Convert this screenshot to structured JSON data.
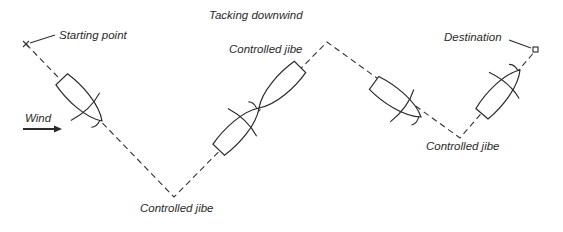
{
  "title": "Tacking downwind",
  "labels": {
    "start": "Starting point",
    "destination": "Destination",
    "wind": "Wind",
    "jibe_top": "Controlled jibe",
    "jibe_bottom_left": "Controlled jibe",
    "jibe_bottom_right": "Controlled jibe"
  },
  "course_points": [
    [
      26,
      44
    ],
    [
      174,
      197
    ],
    [
      327,
      42
    ],
    [
      460,
      138
    ],
    [
      536,
      50
    ]
  ],
  "colors": {
    "ink": "#2a2a2a",
    "background": "#ffffff"
  }
}
